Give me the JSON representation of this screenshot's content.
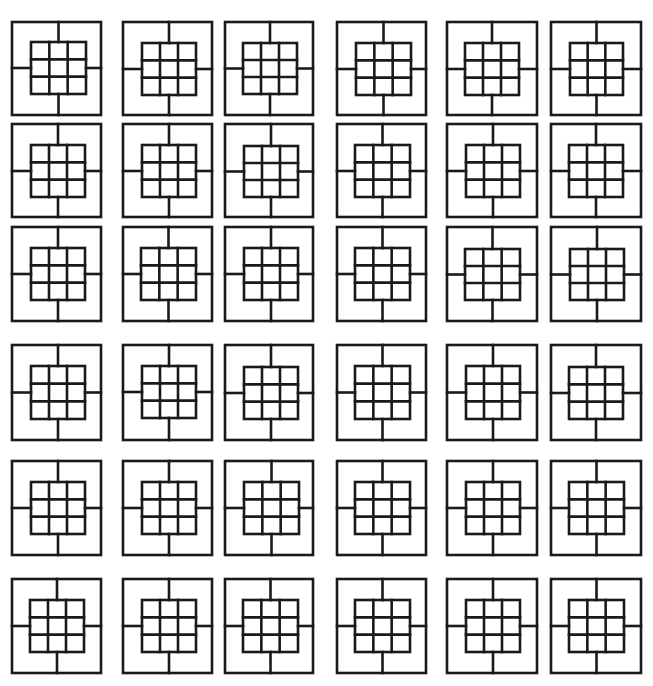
{
  "canvas": {
    "width": 653,
    "height": 686,
    "background": "#ffffff",
    "stroke": "#1a1a1a"
  },
  "pattern": {
    "description": "Repeated tile: outer square, centered 3x3 grid, four connector lines from grid midpoints to outer edges",
    "grid_rows": 3,
    "grid_cols": 3,
    "stroke_width": 2.6
  },
  "columns": [
    {
      "x": 12,
      "w": 89
    },
    {
      "x": 123,
      "w": 89
    },
    {
      "x": 225,
      "w": 88
    },
    {
      "x": 337,
      "w": 89
    },
    {
      "x": 447,
      "w": 90
    },
    {
      "x": 551,
      "w": 90
    }
  ],
  "rows": [
    {
      "y": 22,
      "h": 93
    },
    {
      "y": 124,
      "h": 93
    },
    {
      "y": 227,
      "h": 94
    },
    {
      "y": 345,
      "h": 95
    },
    {
      "y": 461,
      "h": 94
    },
    {
      "y": 579,
      "h": 94
    }
  ],
  "tiles": [
    [
      {
        "ix": 19,
        "iy": 20,
        "iw": 55,
        "ih": 52
      },
      {
        "ix": 19,
        "iy": 21,
        "iw": 54,
        "ih": 52
      },
      {
        "ix": 18,
        "iy": 21,
        "iw": 54,
        "ih": 51
      },
      {
        "ix": 19,
        "iy": 21,
        "iw": 55,
        "ih": 52
      },
      {
        "ix": 18,
        "iy": 21,
        "iw": 54,
        "ih": 52
      },
      {
        "ix": 19,
        "iy": 21,
        "iw": 53,
        "ih": 52
      }
    ],
    [
      {
        "ix": 19,
        "iy": 21,
        "iw": 54,
        "ih": 52
      },
      {
        "ix": 19,
        "iy": 21,
        "iw": 54,
        "ih": 52
      },
      {
        "ix": 19,
        "iy": 22,
        "iw": 54,
        "ih": 51
      },
      {
        "ix": 18,
        "iy": 21,
        "iw": 55,
        "ih": 52
      },
      {
        "ix": 19,
        "iy": 21,
        "iw": 54,
        "ih": 52
      },
      {
        "ix": 18,
        "iy": 21,
        "iw": 54,
        "ih": 52
      }
    ],
    [
      {
        "ix": 19,
        "iy": 21,
        "iw": 54,
        "ih": 52
      },
      {
        "ix": 18,
        "iy": 21,
        "iw": 55,
        "ih": 52
      },
      {
        "ix": 19,
        "iy": 21,
        "iw": 54,
        "ih": 52
      },
      {
        "ix": 18,
        "iy": 21,
        "iw": 55,
        "ih": 52
      },
      {
        "ix": 18,
        "iy": 22,
        "iw": 55,
        "ih": 51
      },
      {
        "ix": 19,
        "iy": 22,
        "iw": 54,
        "ih": 51
      }
    ],
    [
      {
        "ix": 19,
        "iy": 21,
        "iw": 54,
        "ih": 53
      },
      {
        "ix": 19,
        "iy": 21,
        "iw": 54,
        "ih": 52
      },
      {
        "ix": 19,
        "iy": 22,
        "iw": 54,
        "ih": 52
      },
      {
        "ix": 18,
        "iy": 21,
        "iw": 55,
        "ih": 53
      },
      {
        "ix": 19,
        "iy": 21,
        "iw": 54,
        "ih": 53
      },
      {
        "ix": 18,
        "iy": 22,
        "iw": 54,
        "ih": 52
      }
    ],
    [
      {
        "ix": 19,
        "iy": 21,
        "iw": 54,
        "ih": 52
      },
      {
        "ix": 19,
        "iy": 21,
        "iw": 54,
        "ih": 52
      },
      {
        "ix": 19,
        "iy": 21,
        "iw": 55,
        "ih": 52
      },
      {
        "ix": 18,
        "iy": 21,
        "iw": 55,
        "ih": 52
      },
      {
        "ix": 19,
        "iy": 21,
        "iw": 54,
        "ih": 52
      },
      {
        "ix": 18,
        "iy": 21,
        "iw": 55,
        "ih": 52
      }
    ],
    [
      {
        "ix": 18,
        "iy": 21,
        "iw": 54,
        "ih": 52
      },
      {
        "ix": 19,
        "iy": 21,
        "iw": 54,
        "ih": 52
      },
      {
        "ix": 18,
        "iy": 21,
        "iw": 55,
        "ih": 52
      },
      {
        "ix": 18,
        "iy": 21,
        "iw": 55,
        "ih": 52
      },
      {
        "ix": 19,
        "iy": 21,
        "iw": 54,
        "ih": 52
      },
      {
        "ix": 18,
        "iy": 21,
        "iw": 55,
        "ih": 52
      }
    ]
  ]
}
